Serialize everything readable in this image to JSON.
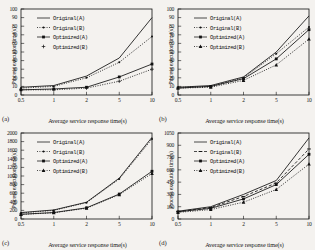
{
  "figure": {
    "background": "#f4f2ef",
    "ink": "#111111",
    "panels": [
      "(a)",
      "(b)",
      "(c)",
      "(d)"
    ]
  },
  "chart_data": [
    {
      "type": "line",
      "panel": "(a)",
      "title": "",
      "xlabel": "Average service response time(s)",
      "ylabel": "Process execution time(s)",
      "categories": [
        "0.5",
        "1",
        "2",
        "5",
        "10"
      ],
      "x": [
        0.5,
        1,
        2,
        5,
        10
      ],
      "ylim": [
        0,
        100
      ],
      "yticks": [
        0,
        10,
        20,
        30,
        40,
        50,
        60,
        70,
        80,
        90,
        100
      ],
      "grid": false,
      "legend_position": "upper-left",
      "series": [
        {
          "name": "Original(A)",
          "values": [
            9,
            11,
            22,
            43,
            90
          ],
          "style": "solid",
          "marker": "line"
        },
        {
          "name": "Original(B)",
          "values": [
            8,
            10,
            20,
            38,
            68
          ],
          "style": "dotted",
          "marker": "dot"
        },
        {
          "name": "Optimized(A)",
          "values": [
            6,
            7,
            9,
            21,
            36
          ],
          "style": "solid",
          "marker": "square"
        },
        {
          "name": "Optimized(B)",
          "values": [
            6,
            6,
            8,
            16,
            30
          ],
          "style": "dotted",
          "marker": "plus"
        }
      ]
    },
    {
      "type": "line",
      "panel": "(b)",
      "title": "",
      "xlabel": "Average service response time(s)",
      "ylabel": "Process execution time(s)",
      "categories": [
        "0.5",
        "1",
        "2",
        "5",
        "10"
      ],
      "x": [
        0.5,
        1,
        2,
        5,
        10
      ],
      "ylim": [
        0,
        100
      ],
      "yticks": [
        0,
        10,
        20,
        30,
        40,
        50,
        60,
        70,
        80,
        90,
        100
      ],
      "grid": false,
      "legend_position": "upper-left",
      "series": [
        {
          "name": "Original(A)",
          "values": [
            9,
            11,
            21,
            50,
            92
          ],
          "style": "solid",
          "marker": "line"
        },
        {
          "name": "Original(B)",
          "values": [
            9,
            10,
            20,
            48,
            79
          ],
          "style": "dotted",
          "marker": "dot"
        },
        {
          "name": "Optimized(A)",
          "values": [
            8,
            10,
            19,
            42,
            76
          ],
          "style": "solid",
          "marker": "square"
        },
        {
          "name": "Optimized(B)",
          "values": [
            8,
            9,
            17,
            35,
            65
          ],
          "style": "dotted",
          "marker": "triangle"
        }
      ]
    },
    {
      "type": "line",
      "panel": "(c)",
      "title": "",
      "xlabel": "Average service response time(s)",
      "ylabel": "Process execution time(s)",
      "categories": [
        "0.5",
        "1",
        "2",
        "5",
        "10"
      ],
      "x": [
        0.5,
        1,
        2,
        5,
        10
      ],
      "ylim": [
        0,
        2000
      ],
      "yticks": [
        0,
        200,
        400,
        600,
        800,
        1000,
        1200,
        1400,
        1600,
        1800,
        2000
      ],
      "grid": false,
      "legend_position": "upper-left",
      "series": [
        {
          "name": "Original(A)",
          "values": [
            150,
            210,
            390,
            950,
            1900
          ],
          "style": "solid",
          "marker": "line"
        },
        {
          "name": "Original(B)",
          "values": [
            140,
            200,
            380,
            930,
            1860
          ],
          "style": "dotted",
          "marker": "dot"
        },
        {
          "name": "Optimized(A)",
          "values": [
            110,
            150,
            260,
            580,
            1110
          ],
          "style": "solid",
          "marker": "square"
        },
        {
          "name": "Optimized(B)",
          "values": [
            105,
            145,
            250,
            565,
            1060
          ],
          "style": "dotted",
          "marker": "triangle"
        }
      ]
    },
    {
      "type": "line",
      "panel": "(d)",
      "title": "",
      "xlabel": "Average service response time(s)",
      "ylabel": "Process execution time(s)",
      "categories": [
        "0.5",
        "1",
        "2",
        "5",
        "10"
      ],
      "x": [
        0.5,
        1,
        2,
        5,
        10
      ],
      "ylim": [
        0,
        1050
      ],
      "yticks": [
        0,
        150,
        300,
        450,
        600,
        750,
        900,
        1050
      ],
      "grid": false,
      "legend_position": "upper-left",
      "series": [
        {
          "name": "Original(A)",
          "values": [
            95,
            150,
            300,
            470,
            990
          ],
          "style": "solid",
          "marker": "line"
        },
        {
          "name": "Original(B)",
          "values": [
            90,
            140,
            275,
            440,
            855
          ],
          "style": "dashed",
          "marker": "dash"
        },
        {
          "name": "Optimized(A)",
          "values": [
            88,
            130,
            245,
            420,
            790
          ],
          "style": "solid",
          "marker": "square"
        },
        {
          "name": "Optimized(B)",
          "values": [
            80,
            115,
            205,
            360,
            670
          ],
          "style": "dotted",
          "marker": "triangle"
        }
      ]
    }
  ]
}
